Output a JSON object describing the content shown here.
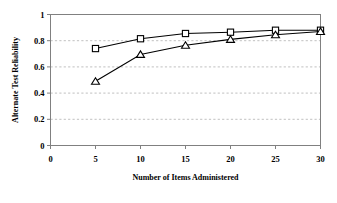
{
  "chart_data": {
    "type": "line",
    "title": "",
    "xlabel": "Number of Items Administered",
    "ylabel": "Alternate Test Reliability",
    "x": [
      5,
      10,
      15,
      20,
      25,
      30
    ],
    "xlim": [
      0,
      30
    ],
    "ylim": [
      0,
      1
    ],
    "xticks": [
      "0",
      "5",
      "10",
      "15",
      "20",
      "25",
      "30"
    ],
    "xtick_values": [
      0,
      5,
      10,
      15,
      20,
      25,
      30
    ],
    "yticks": [
      "0",
      "0.2",
      "0.4",
      "0.6",
      "0.8",
      "1"
    ],
    "ytick_values": [
      0,
      0.2,
      0.4,
      0.6,
      0.8,
      1
    ],
    "grid": "horizontal-dashed",
    "legend": "none",
    "series": [
      {
        "name": "square-series",
        "marker": "square",
        "color": "#000000",
        "values": [
          0.74,
          0.815,
          0.855,
          0.865,
          0.88,
          0.88
        ]
      },
      {
        "name": "triangle-series",
        "marker": "triangle",
        "color": "#000000",
        "values": [
          0.49,
          0.695,
          0.765,
          0.81,
          0.845,
          0.87
        ]
      }
    ]
  },
  "style": {
    "axis_color": "#808080",
    "grid_color": "#b0b0b0",
    "line_color": "#000000",
    "background": "#ffffff"
  }
}
